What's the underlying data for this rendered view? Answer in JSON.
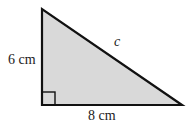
{
  "diagram": {
    "type": "right-triangle",
    "fill_color": "#d9d9d9",
    "stroke_color": "#111111",
    "vertical_leg_label": "6 cm",
    "horizontal_leg_label": "8 cm",
    "hypotenuse_label": "c",
    "right_angle_marker": true
  }
}
